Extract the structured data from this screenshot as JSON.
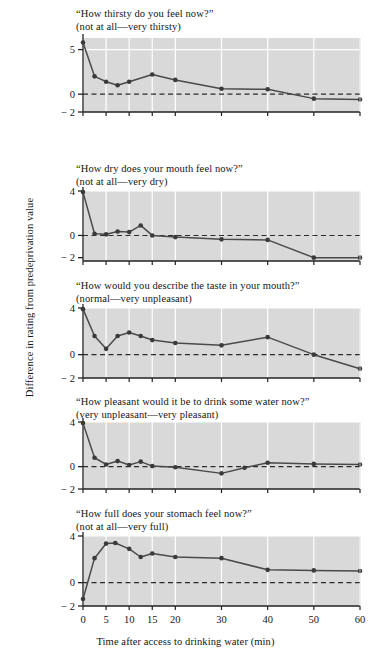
{
  "figure": {
    "ylabel": "Difference in rating from predeprivation value",
    "xlabel": "Time after access to drinking water (min)",
    "background_color": "#ffffff",
    "plot_background_color": "#d9d9d9",
    "gridline_color": "#ffffff",
    "line_color": "#4a4a4a",
    "marker_color": "#3a3a3a",
    "zero_line_style": "dashed"
  },
  "chart_data": [
    {
      "type": "line",
      "title": "“How thirsty do you feel now?”",
      "subtitle": "(not at all—very thirsty)",
      "xlabel": "Time after access to drinking water (min)",
      "ylabel": "Difference in rating from predeprivation value",
      "xlim": [
        0,
        60
      ],
      "ylim": [
        -2,
        6.3
      ],
      "yticks": [
        5,
        0,
        -2
      ],
      "ytick_labels": [
        "5",
        "0",
        "− 2"
      ],
      "xticks": [
        0,
        5,
        10,
        15,
        20,
        30,
        40,
        50,
        60
      ],
      "xtick_labels": [
        "0",
        "5",
        "10",
        "15",
        "20",
        "30",
        "40",
        "50",
        "60"
      ],
      "grid": true,
      "zero_reference_line": 0,
      "x": [
        0,
        2.5,
        5,
        7.5,
        10,
        15,
        20,
        30,
        40,
        50,
        60
      ],
      "values": [
        5.8,
        2.0,
        1.4,
        1.0,
        1.4,
        2.2,
        1.6,
        0.6,
        0.55,
        -0.5,
        -0.6
      ]
    },
    {
      "type": "line",
      "title": "“How dry does your mouth feel now?”",
      "subtitle": "(not at all—very dry)",
      "xlabel": "Time after access to drinking water (min)",
      "ylabel": "Difference in rating from predeprivation value",
      "xlim": [
        0,
        60
      ],
      "ylim": [
        -2.3,
        4
      ],
      "yticks": [
        4,
        0,
        -2
      ],
      "ytick_labels": [
        "4",
        "0",
        "− 2"
      ],
      "xticks": [
        0,
        5,
        10,
        15,
        20,
        30,
        40,
        50,
        60
      ],
      "xtick_labels": [
        "0",
        "5",
        "10",
        "15",
        "20",
        "30",
        "40",
        "50",
        "60"
      ],
      "grid": true,
      "zero_reference_line": 0,
      "x": [
        0,
        2.5,
        5,
        7.5,
        10,
        12.5,
        15,
        20,
        30,
        40,
        50,
        60
      ],
      "values": [
        3.9,
        0.15,
        0.1,
        0.35,
        0.3,
        0.9,
        0.0,
        -0.15,
        -0.35,
        -0.4,
        -2.0,
        -2.0
      ]
    },
    {
      "type": "line",
      "title": "“How would you describe the taste in your mouth?”",
      "subtitle": "(normal—very unpleasant)",
      "xlabel": "Time after access to drinking water (min)",
      "ylabel": "Difference in rating from predeprivation value",
      "xlim": [
        0,
        60
      ],
      "ylim": [
        -2,
        4
      ],
      "yticks": [
        4,
        0,
        -2
      ],
      "ytick_labels": [
        "4",
        "0",
        "− 2"
      ],
      "xticks": [
        0,
        5,
        10,
        15,
        20,
        30,
        40,
        50,
        60
      ],
      "xtick_labels": [
        "0",
        "5",
        "10",
        "15",
        "20",
        "30",
        "40",
        "50",
        "60"
      ],
      "grid": true,
      "zero_reference_line": 0,
      "x": [
        0,
        2.5,
        5,
        7.5,
        10,
        12.5,
        15,
        20,
        30,
        40,
        50,
        60
      ],
      "values": [
        3.9,
        1.6,
        0.5,
        1.6,
        1.9,
        1.6,
        1.25,
        1.0,
        0.8,
        1.5,
        0.0,
        -1.2
      ]
    },
    {
      "type": "line",
      "title": "“How pleasant would it be to drink some water now?”",
      "subtitle": "(very unpleasant—very pleasant)",
      "xlabel": "Time after access to drinking water (min)",
      "ylabel": "Difference in rating from predeprivation value",
      "xlim": [
        0,
        60
      ],
      "ylim": [
        -2,
        4
      ],
      "yticks": [
        4,
        0,
        -2
      ],
      "ytick_labels": [
        "4",
        "0",
        "− 2"
      ],
      "xticks": [
        0,
        5,
        10,
        15,
        20,
        30,
        40,
        50,
        60
      ],
      "xtick_labels": [
        "0",
        "5",
        "10",
        "15",
        "20",
        "30",
        "40",
        "50",
        "60"
      ],
      "grid": true,
      "zero_reference_line": 0,
      "x": [
        0,
        2.5,
        5,
        7.5,
        10,
        12.5,
        15,
        20,
        30,
        35,
        40,
        50,
        60
      ],
      "values": [
        3.9,
        0.8,
        0.2,
        0.5,
        0.15,
        0.45,
        0.05,
        -0.05,
        -0.6,
        -0.1,
        0.35,
        0.25,
        0.2
      ]
    },
    {
      "type": "line",
      "title": "“How full does your stomach feel now?”",
      "subtitle": "(not at all—very full)",
      "xlabel": "Time after access to drinking water (min)",
      "ylabel": "Difference in rating from predeprivation value",
      "xlim": [
        0,
        60
      ],
      "ylim": [
        -2,
        4
      ],
      "yticks": [
        4,
        0,
        -2
      ],
      "ytick_labels": [
        "4",
        "0",
        "− 2"
      ],
      "xticks": [
        0,
        5,
        10,
        15,
        20,
        30,
        40,
        50,
        60
      ],
      "xtick_labels": [
        "0",
        "5",
        "10",
        "15",
        "20",
        "30",
        "40",
        "50",
        "60"
      ],
      "grid": true,
      "zero_reference_line": 0,
      "x": [
        0,
        2.5,
        5,
        7,
        10,
        12.5,
        15,
        20,
        30,
        40,
        50,
        60
      ],
      "values": [
        -1.4,
        2.1,
        3.35,
        3.4,
        2.9,
        2.2,
        2.5,
        2.2,
        2.1,
        1.1,
        1.05,
        1.0
      ]
    }
  ],
  "panels": [
    {
      "title": "“How thirsty do you feel now?”",
      "subtitle": "(not at all—very thirsty)"
    },
    {
      "title": "“How dry does your mouth feel now?”",
      "subtitle": "(not at all—very dry)"
    },
    {
      "title": "“How would you describe the taste in your mouth?”",
      "subtitle": "(normal—very unpleasant)"
    },
    {
      "title": "“How pleasant would it be to drink some water now?”",
      "subtitle": "(very unpleasant—very pleasant)"
    },
    {
      "title": "“How full does your stomach feel now?”",
      "subtitle": "(not at all—very full)"
    }
  ]
}
